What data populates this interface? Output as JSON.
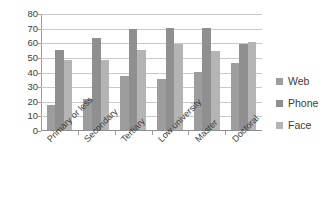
{
  "chart_data": {
    "type": "bar",
    "title": "",
    "subtitle": "",
    "xlabel": "",
    "ylabel": "",
    "categories": [
      "Primary or less",
      "Secondary",
      "Tertiary",
      "Low university",
      "Master",
      "Doctoral"
    ],
    "series": [
      {
        "name": "Web",
        "color": "#9d9d9d",
        "values": [
          17,
          21,
          37,
          35,
          40,
          46
        ]
      },
      {
        "name": "Phone",
        "color": "#8f8f8f",
        "values": [
          55,
          63,
          69,
          70,
          70,
          59
        ]
      },
      {
        "name": "Face",
        "color": "#b4b4b4",
        "values": [
          48,
          48,
          55,
          59,
          54,
          60
        ]
      }
    ],
    "ylim": [
      0,
      80
    ],
    "ytick_step": 10,
    "yticks": [
      "0",
      "10",
      "20",
      "30",
      "40",
      "50",
      "60",
      "70",
      "80"
    ],
    "grid": true,
    "grid_axis": "y",
    "legend_position": "right",
    "legend": [
      "Web",
      "Phone",
      "Face"
    ],
    "annotations": []
  }
}
